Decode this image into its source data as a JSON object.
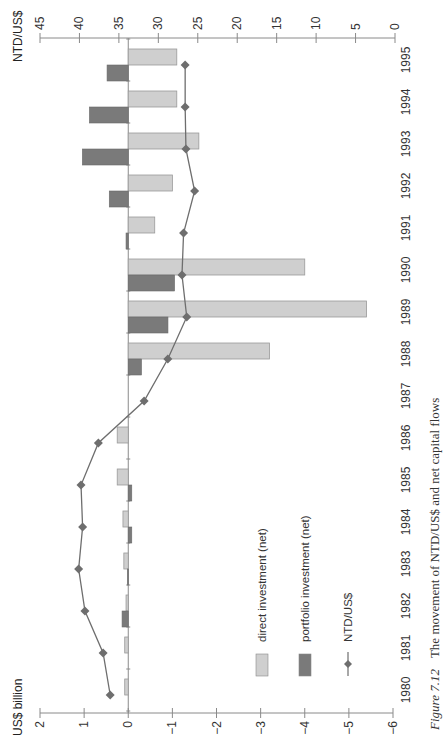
{
  "chart_data": {
    "type": "bar",
    "orientation": "rotated -90 degrees (years run bottom-to-top on page)",
    "title": "",
    "caption": {
      "prefix": "Figure 7.12",
      "text": "The movement of NTD/US$ and net capital flows"
    },
    "categories": [
      "1980",
      "1981",
      "1982",
      "1983",
      "1984",
      "1985",
      "1986",
      "1987",
      "1988",
      "1989",
      "1990",
      "1991",
      "1992",
      "1993",
      "1994",
      "1995"
    ],
    "series": [
      {
        "name": "direct investment (net)",
        "type": "bar",
        "axis": "left",
        "color": "#cfcfcf",
        "values": [
          0.08,
          0.08,
          0.05,
          0.1,
          0.12,
          0.25,
          0.25,
          0.0,
          -3.2,
          -5.4,
          -4.0,
          -0.6,
          -1.0,
          -1.6,
          -1.1,
          -1.1
        ]
      },
      {
        "name": "portfolio investment (net)",
        "type": "bar",
        "axis": "left",
        "color": "#7a7a7a",
        "values": [
          0.0,
          0.0,
          0.14,
          0.02,
          -0.08,
          -0.08,
          0.0,
          0.0,
          -0.3,
          -0.9,
          -1.05,
          0.05,
          0.43,
          1.04,
          0.88,
          0.48
        ]
      },
      {
        "name": "NTD/US$",
        "type": "line",
        "axis": "right",
        "color": "#6e6e6e",
        "marker": "diamond",
        "values": [
          36.1,
          37.0,
          39.3,
          40.1,
          39.6,
          39.8,
          37.6,
          31.8,
          28.8,
          26.4,
          27.0,
          26.8,
          25.4,
          26.5,
          26.6,
          26.6
        ]
      }
    ],
    "left_axis": {
      "label": "US$ billion",
      "range": [
        -6,
        2
      ],
      "ticks": [
        "2",
        "1",
        "0",
        "−1",
        "−2",
        "−3",
        "−4",
        "−5",
        "−6"
      ],
      "tick_values": [
        2,
        1,
        0,
        -1,
        -2,
        -3,
        -4,
        -5,
        -6
      ]
    },
    "right_axis": {
      "label": "NTD/US$",
      "range": [
        0,
        45
      ],
      "ticks": [
        "45",
        "40",
        "35",
        "30",
        "25",
        "20",
        "15",
        "10",
        "5",
        "0"
      ],
      "tick_values": [
        45,
        40,
        35,
        30,
        25,
        20,
        15,
        10,
        5,
        0
      ]
    },
    "xlabel": "",
    "grid": false,
    "legend": {
      "position": "inside, lower-middle of plot",
      "entries": [
        {
          "label": "direct investment (net)",
          "kind": "box",
          "color": "#cfcfcf"
        },
        {
          "label": "portfolio investment (net)",
          "kind": "box",
          "color": "#7a7a7a"
        },
        {
          "label": "NTD/US$",
          "kind": "line-diamond",
          "color": "#6e6e6e"
        }
      ]
    }
  }
}
